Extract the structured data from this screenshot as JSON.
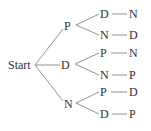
{
  "diagram": {
    "type": "tree",
    "root": "Start",
    "level1": [
      {
        "label": "P",
        "children": [
          {
            "label": "D",
            "leaf": "N"
          },
          {
            "label": "N",
            "leaf": "D"
          }
        ]
      },
      {
        "label": "D",
        "children": [
          {
            "label": "P",
            "leaf": "N"
          },
          {
            "label": "N",
            "leaf": "P"
          }
        ]
      },
      {
        "label": "N",
        "children": [
          {
            "label": "P",
            "leaf": "D"
          },
          {
            "label": "D",
            "leaf": "P"
          }
        ]
      }
    ]
  }
}
